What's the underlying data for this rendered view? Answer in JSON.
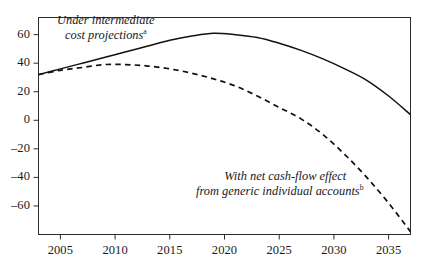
{
  "chart_data": {
    "type": "line",
    "title": "",
    "subtitle": "",
    "xlabel": "",
    "ylabel": "",
    "xlim": [
      2003,
      2037
    ],
    "ylim": [
      -80,
      72
    ],
    "grid": false,
    "legend_position": "inline-annotations",
    "x_ticks": [
      "2005",
      "2010",
      "2015",
      "2020",
      "2025",
      "2030",
      "2035"
    ],
    "x_tick_values": [
      2005,
      2010,
      2015,
      2020,
      2025,
      2030,
      2035
    ],
    "y_ticks": [
      "60",
      "40",
      "20",
      "0",
      "–20",
      "–40",
      "–60"
    ],
    "y_tick_values": [
      60,
      40,
      20,
      0,
      -20,
      -40,
      -60
    ],
    "series": [
      {
        "name": "Under intermediate cost projections",
        "style": "solid",
        "color": "#111111",
        "x": [
          2003,
          2005,
          2007,
          2009,
          2011,
          2013,
          2015,
          2017,
          2019,
          2021,
          2023,
          2025,
          2027,
          2029,
          2031,
          2033,
          2035,
          2037
        ],
        "values": [
          32,
          36,
          40,
          44,
          48,
          52,
          56,
          59,
          61,
          60,
          58,
          54,
          49,
          43,
          36,
          28,
          17,
          4
        ]
      },
      {
        "name": "With net cash-flow effect from generic individual accounts",
        "style": "dashed",
        "color": "#111111",
        "x": [
          2003,
          2005,
          2007,
          2009,
          2011,
          2013,
          2015,
          2017,
          2019,
          2021,
          2023,
          2025,
          2027,
          2029,
          2031,
          2033,
          2035,
          2037
        ],
        "values": [
          32,
          35,
          37,
          39,
          39,
          38,
          36,
          33,
          29,
          24,
          17,
          9,
          1,
          -10,
          -24,
          -40,
          -58,
          -78
        ]
      }
    ],
    "annotations": [
      {
        "id": "solid-curve-label",
        "line1": "Under intermediate",
        "line2": "cost projections",
        "footnote_marker": "a"
      },
      {
        "id": "dashed-curve-label",
        "line1": "With net cash-flow effect",
        "line2": "from generic individual accounts",
        "footnote_marker": "b"
      }
    ]
  }
}
